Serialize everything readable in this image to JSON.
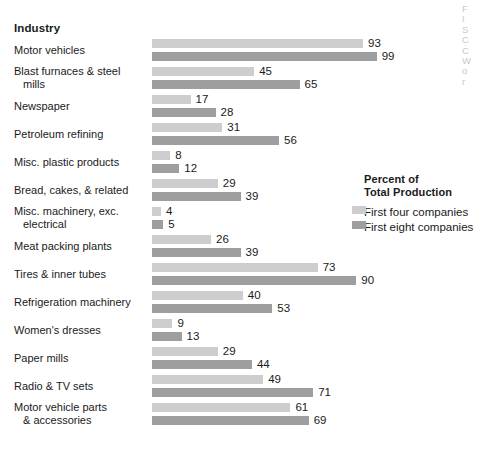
{
  "header": {
    "column_title": "Industry"
  },
  "bleed_text": [
    "F",
    "I",
    "S",
    "C",
    "C",
    "W",
    "o",
    "r"
  ],
  "legend": {
    "title_line1": "Percent of",
    "title_line2": "Total Production",
    "entries": [
      {
        "label": "First four companies",
        "swatch": "light",
        "color": "#cdcdcd"
      },
      {
        "label": "First eight companies",
        "swatch": "dark",
        "color": "#9e9e9e"
      }
    ]
  },
  "chart_data": {
    "type": "bar",
    "orientation": "horizontal",
    "title": "Industry",
    "xlabel": "Percent of Total Production",
    "ylabel": "Industry",
    "xlim": [
      0,
      100
    ],
    "grid": false,
    "legend_position": "right",
    "value_labels": true,
    "categories": [
      "Motor vehicles",
      "Blast furnaces & steel mills",
      "Newspaper",
      "Petroleum refining",
      "Misc. plastic products",
      "Bread, cakes, & related",
      "Misc. machinery, exc. electrical",
      "Meat packing plants",
      "Tires & inner tubes",
      "Refrigeration machinery",
      "Women's dresses",
      "Paper mills",
      "Radio & TV sets",
      "Motor vehicle parts & accessories"
    ],
    "category_lines": [
      [
        "Motor vehicles"
      ],
      [
        "Blast furnaces & steel",
        "mills"
      ],
      [
        "Newspaper"
      ],
      [
        "Petroleum refining"
      ],
      [
        "Misc. plastic products"
      ],
      [
        "Bread, cakes, & related"
      ],
      [
        "Misc. machinery, exc.",
        "electrical"
      ],
      [
        "Meat packing plants"
      ],
      [
        "Tires & inner tubes"
      ],
      [
        "Refrigeration machinery"
      ],
      [
        "Women's dresses"
      ],
      [
        "Paper mills"
      ],
      [
        "Radio & TV sets"
      ],
      [
        "Motor vehicle parts",
        "& accessories"
      ]
    ],
    "series": [
      {
        "name": "First four companies",
        "color": "#cdcdcd",
        "values": [
          93,
          45,
          17,
          31,
          8,
          29,
          4,
          26,
          73,
          40,
          9,
          29,
          49,
          61
        ]
      },
      {
        "name": "First eight companies",
        "color": "#9e9e9e",
        "values": [
          99,
          65,
          28,
          56,
          12,
          39,
          5,
          39,
          90,
          53,
          13,
          44,
          71,
          69
        ]
      }
    ]
  }
}
